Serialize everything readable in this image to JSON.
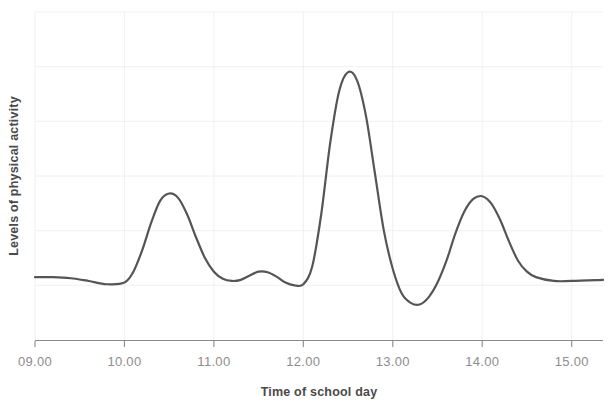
{
  "chart_data": {
    "type": "line",
    "title": "",
    "xlabel": "Time of school day",
    "ylabel": "Levels of physical activity",
    "xlim": [
      9.0,
      15.35
    ],
    "ylim": [
      0,
      6
    ],
    "grid": true,
    "grid_y_count": 6,
    "grid_x_at_ticks": true,
    "legend": "none",
    "x_tick_labels": [
      "09.00",
      "10.00",
      "11.00",
      "12.00",
      "13.00",
      "14.00",
      "15.00"
    ],
    "x_tick_values": [
      9,
      10,
      11,
      12,
      13,
      14,
      15
    ],
    "y_tick_labels": [],
    "series": [
      {
        "name": "Levels of physical activity",
        "color": "#555555",
        "line_width": 2.2,
        "x": [
          9.0,
          9.2,
          9.4,
          9.6,
          9.8,
          10.0,
          10.1,
          10.2,
          10.3,
          10.4,
          10.5,
          10.6,
          10.7,
          10.8,
          10.9,
          11.0,
          11.1,
          11.2,
          11.3,
          11.4,
          11.5,
          11.6,
          11.7,
          11.8,
          11.9,
          12.0,
          12.1,
          12.2,
          12.3,
          12.4,
          12.5,
          12.6,
          12.7,
          12.8,
          12.9,
          13.0,
          13.1,
          13.2,
          13.3,
          13.4,
          13.5,
          13.6,
          13.7,
          13.8,
          13.9,
          14.0,
          14.1,
          14.2,
          14.3,
          14.4,
          14.5,
          14.6,
          14.8,
          15.0,
          15.35
        ],
        "y": [
          1.15,
          1.15,
          1.13,
          1.08,
          1.02,
          1.05,
          1.25,
          1.65,
          2.15,
          2.55,
          2.68,
          2.6,
          2.3,
          1.88,
          1.5,
          1.25,
          1.12,
          1.08,
          1.1,
          1.18,
          1.25,
          1.24,
          1.16,
          1.05,
          1.0,
          1.02,
          1.35,
          2.3,
          3.6,
          4.55,
          4.9,
          4.75,
          4.1,
          3.05,
          2.0,
          1.3,
          0.85,
          0.68,
          0.65,
          0.78,
          1.05,
          1.45,
          1.95,
          2.35,
          2.58,
          2.63,
          2.5,
          2.2,
          1.8,
          1.45,
          1.25,
          1.15,
          1.08,
          1.08,
          1.1
        ]
      }
    ],
    "annotations": [
      {
        "label": "morning peak",
        "x": 10.5,
        "y": 2.68
      },
      {
        "label": "lunchtime peak",
        "x": 12.5,
        "y": 4.9
      },
      {
        "label": "afternoon peak",
        "x": 14.0,
        "y": 2.63
      },
      {
        "label": "lowest trough",
        "x": 13.3,
        "y": 0.65
      }
    ],
    "colors": {
      "line": "#555555",
      "grid": "#f0f0f0",
      "axis": "#8a8a8a",
      "tick_label": "#8d8d8d",
      "axis_title": "#4a4a4a",
      "background": "#ffffff"
    }
  }
}
